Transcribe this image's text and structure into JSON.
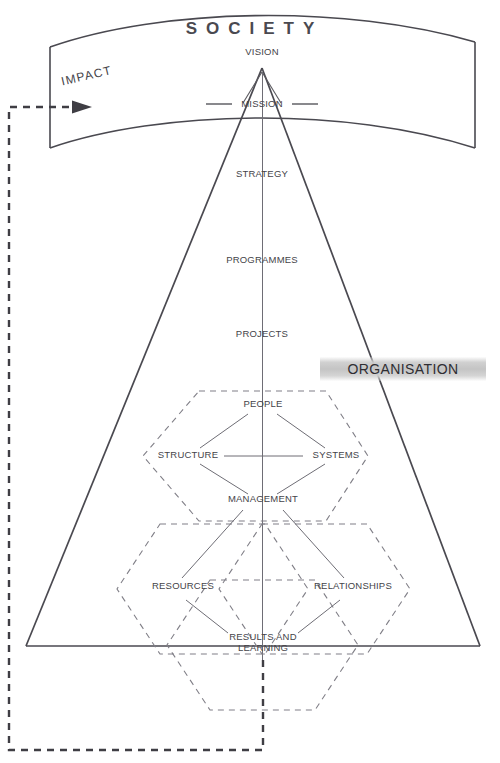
{
  "diagram": {
    "title": "SOCIETY",
    "banner": {
      "label": "ORGANISATION"
    },
    "impact": {
      "label": "IMPACT"
    },
    "pyramid_levels": [
      {
        "id": "vision",
        "label": "VISION"
      },
      {
        "id": "mission",
        "label": "MISSION"
      },
      {
        "id": "strategy",
        "label": "STRATEGY"
      },
      {
        "id": "programmes",
        "label": "PROGRAMMES"
      },
      {
        "id": "projects",
        "label": "PROJECTS"
      }
    ],
    "organisation_nodes": [
      {
        "id": "people",
        "label": "PEOPLE"
      },
      {
        "id": "structure",
        "label": "STRUCTURE"
      },
      {
        "id": "systems",
        "label": "SYSTEMS"
      },
      {
        "id": "management",
        "label": "MANAGEMENT"
      },
      {
        "id": "resources",
        "label": "RESOURCES"
      },
      {
        "id": "relationships",
        "label": "RELATIONSHIPS"
      },
      {
        "id": "results",
        "label_line1": "RESULTS AND",
        "label_line2": "LEARNING"
      }
    ],
    "colors": {
      "line": "#4a4950",
      "dashed": "#7e7d85",
      "text": "#444349",
      "banner": "#c4c4c4",
      "background": "#ffffff"
    }
  }
}
